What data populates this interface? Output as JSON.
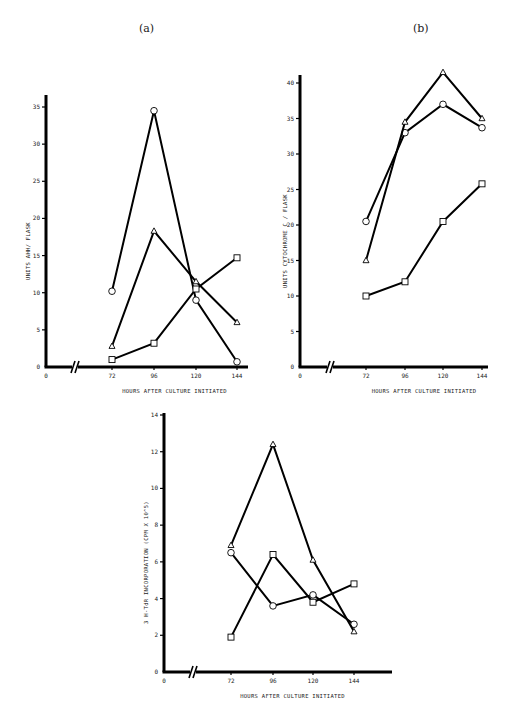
{
  "chart_data": [
    {
      "panel": "(a)",
      "type": "line",
      "title": "",
      "xlabel": "HOURS AFTER CULTURE INITIATED",
      "ylabel": "UNITS AHH/ FLASK",
      "x": [
        72,
        96,
        120,
        144
      ],
      "x_ticks": [
        "0",
        "72",
        "96",
        "120",
        "144"
      ],
      "y_ticks": [
        "0",
        "5",
        "10",
        "15",
        "20",
        "25",
        "30",
        "35"
      ],
      "ylim": [
        0,
        35
      ],
      "axis_break": true,
      "grid": false,
      "legend": "none",
      "series": [
        {
          "name": "circle",
          "marker": "circle",
          "values": [
            10.2,
            34.5,
            9.0,
            0.7
          ]
        },
        {
          "name": "triangle",
          "marker": "triangle",
          "values": [
            2.8,
            18.3,
            11.5,
            6.0
          ]
        },
        {
          "name": "square",
          "marker": "square",
          "values": [
            1.0,
            3.2,
            10.5,
            14.7
          ]
        }
      ]
    },
    {
      "panel": "(b)",
      "type": "line",
      "title": "",
      "xlabel": "HOURS AFTER CULTURE INITIATED",
      "ylabel": "UNITS CYTOCHROME C / FLASK",
      "x": [
        72,
        96,
        120,
        144
      ],
      "x_ticks": [
        "0",
        "72",
        "96",
        "120",
        "144"
      ],
      "y_ticks": [
        "0",
        "5",
        "10",
        "15",
        "20",
        "25",
        "30",
        "35",
        "40"
      ],
      "ylim": [
        0,
        42
      ],
      "axis_break": true,
      "grid": false,
      "legend": "none",
      "series": [
        {
          "name": "circle",
          "marker": "circle",
          "values": [
            20.5,
            33.0,
            37.0,
            33.7
          ]
        },
        {
          "name": "triangle",
          "marker": "triangle",
          "values": [
            15.0,
            34.5,
            41.5,
            35.0
          ]
        },
        {
          "name": "square",
          "marker": "square",
          "values": [
            10.0,
            12.0,
            20.5,
            25.8
          ]
        }
      ]
    },
    {
      "panel": "(c)",
      "type": "line",
      "title": "",
      "xlabel": "HOURS AFTER CULTURE INITIATED",
      "ylabel": "3 H-TdR INCORPORATION (CPM X 10^5)",
      "x": [
        72,
        96,
        120,
        144
      ],
      "x_ticks": [
        "0",
        "72",
        "96",
        "120",
        "144"
      ],
      "y_ticks": [
        "0",
        "2",
        "4",
        "6",
        "8",
        "10",
        "12",
        "14"
      ],
      "ylim": [
        0,
        14
      ],
      "axis_break": true,
      "grid": false,
      "legend": "none",
      "series": [
        {
          "name": "circle",
          "marker": "circle",
          "values": [
            6.5,
            3.6,
            4.2,
            2.6
          ]
        },
        {
          "name": "triangle",
          "marker": "triangle",
          "values": [
            6.9,
            12.4,
            6.1,
            2.2
          ]
        },
        {
          "name": "square",
          "marker": "square",
          "values": [
            1.9,
            6.4,
            3.8,
            4.8
          ]
        }
      ]
    }
  ],
  "labels": {
    "panel_a": "(a)",
    "panel_b": "(b)"
  }
}
